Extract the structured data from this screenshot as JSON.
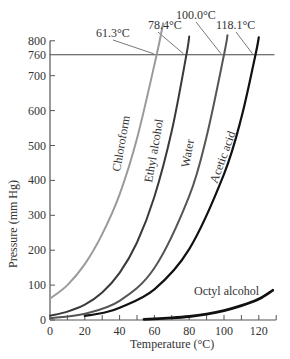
{
  "chart_data": {
    "type": "line",
    "title": "",
    "xlabel": "Temperature (°C)",
    "ylabel": "Pressure (mm Hg)",
    "xlim": [
      0,
      130
    ],
    "ylim": [
      0,
      800
    ],
    "x_ticks": [
      0,
      20,
      40,
      60,
      80,
      100,
      120
    ],
    "y_ticks": [
      0,
      100,
      200,
      300,
      400,
      500,
      600,
      700,
      760,
      800
    ],
    "reference_line": {
      "y": 760,
      "label": "760"
    },
    "grid": false,
    "legend": "inline curve labels",
    "series": [
      {
        "name": "Chloroform",
        "color": "#9a9a9a",
        "boiling_point_label": "61.3°C",
        "x": [
          0,
          10,
          20,
          30,
          40,
          50,
          61.3,
          65
        ],
        "y": [
          61,
          100,
          160,
          246,
          360,
          520,
          760,
          850
        ]
      },
      {
        "name": "Ethyl alcohol",
        "color": "#3a3a3a",
        "boiling_point_label": "78.4°C",
        "x": [
          0,
          10,
          20,
          30,
          40,
          50,
          60,
          70,
          78.4,
          80
        ],
        "y": [
          12,
          24,
          44,
          79,
          135,
          222,
          353,
          542,
          760,
          812
        ]
      },
      {
        "name": "Water",
        "color": "#555555",
        "boiling_point_label": "100.0°C",
        "x": [
          0,
          20,
          40,
          60,
          80,
          90,
          100,
          102
        ],
        "y": [
          5,
          18,
          55,
          149,
          355,
          526,
          760,
          816
        ]
      },
      {
        "name": "Acetic acid",
        "color": "#111111",
        "boiling_point_label": "118.1°C",
        "x": [
          20,
          30,
          40,
          60,
          80,
          100,
          110,
          118.1,
          120
        ],
        "y": [
          12,
          20,
          35,
          88,
          203,
          418,
          580,
          760,
          810
        ]
      },
      {
        "name": "Octyl alcohol",
        "color": "#111111",
        "boiling_point_label": "",
        "x": [
          54,
          70,
          80,
          90,
          100,
          110,
          120,
          128
        ],
        "y": [
          2,
          6,
          10,
          17,
          27,
          41,
          60,
          85
        ]
      }
    ]
  },
  "labels": {
    "x_axis_title": "Temperature (°C)",
    "y_axis_title": "Pressure (mm Hg)",
    "bp_chloroform": "61.3°C",
    "bp_ethyl": "78.4°C",
    "bp_water": "100.0°C",
    "bp_acetic": "118.1°C",
    "curve_chloroform": "Chloroform",
    "curve_ethyl": "Ethyl alcohol",
    "curve_water": "Water",
    "curve_acetic": "Acetic acid",
    "curve_octyl": "Octyl alcohol"
  }
}
